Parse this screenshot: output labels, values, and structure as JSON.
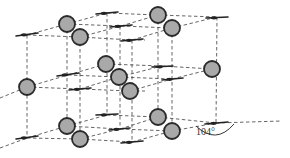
{
  "diagram": {
    "type": "crystal-lattice",
    "angle_label": "104°",
    "colors": {
      "sphere_fill": "#a9a9a9",
      "sphere_stroke": "#2a2a2a",
      "line": "#555555",
      "stick": "#222222",
      "background": "#ffffff"
    },
    "spheres": [
      {
        "id": "top-back-left",
        "x": 67,
        "y": 24,
        "r": 8
      },
      {
        "id": "top-front-left",
        "x": 80,
        "y": 37,
        "r": 8
      },
      {
        "id": "top-back-right",
        "x": 158,
        "y": 15,
        "r": 8
      },
      {
        "id": "top-front-right",
        "x": 172,
        "y": 28,
        "r": 8
      },
      {
        "id": "mid-left",
        "x": 27,
        "y": 87,
        "r": 8
      },
      {
        "id": "mid-center-back",
        "x": 106,
        "y": 64,
        "r": 8
      },
      {
        "id": "mid-center",
        "x": 119,
        "y": 77,
        "r": 8
      },
      {
        "id": "mid-center-front",
        "x": 130,
        "y": 91,
        "r": 8
      },
      {
        "id": "mid-right",
        "x": 212,
        "y": 69,
        "r": 8
      },
      {
        "id": "bottom-back-left",
        "x": 67,
        "y": 126,
        "r": 8
      },
      {
        "id": "bottom-front-left",
        "x": 80,
        "y": 139,
        "r": 8
      },
      {
        "id": "bottom-back-right",
        "x": 158,
        "y": 117,
        "r": 8
      },
      {
        "id": "bottom-front-right",
        "x": 172,
        "y": 131,
        "r": 8
      }
    ],
    "sticks": [
      {
        "x1": 16,
        "y1": 36,
        "x2": 38,
        "y2": 33
      },
      {
        "x1": 96,
        "y1": 14,
        "x2": 118,
        "y2": 12
      },
      {
        "x1": 110,
        "y1": 27,
        "x2": 132,
        "y2": 25
      },
      {
        "x1": 121,
        "y1": 41,
        "x2": 143,
        "y2": 39
      },
      {
        "x1": 206,
        "y1": 18,
        "x2": 228,
        "y2": 17
      },
      {
        "x1": 57,
        "y1": 76,
        "x2": 79,
        "y2": 73
      },
      {
        "x1": 69,
        "y1": 90,
        "x2": 91,
        "y2": 88
      },
      {
        "x1": 152,
        "y1": 67,
        "x2": 173,
        "y2": 66
      },
      {
        "x1": 162,
        "y1": 80,
        "x2": 183,
        "y2": 78
      },
      {
        "x1": 16,
        "y1": 139,
        "x2": 38,
        "y2": 136
      },
      {
        "x1": 96,
        "y1": 115,
        "x2": 118,
        "y2": 114
      },
      {
        "x1": 109,
        "y1": 130,
        "x2": 130,
        "y2": 128
      },
      {
        "x1": 121,
        "y1": 143,
        "x2": 143,
        "y2": 141
      },
      {
        "x1": 205,
        "y1": 124,
        "x2": 228,
        "y2": 122
      }
    ],
    "dashed_lines": [
      {
        "x1": 27,
        "y1": 35,
        "x2": 67,
        "y2": 24
      },
      {
        "x1": 27,
        "y1": 35,
        "x2": 80,
        "y2": 37
      },
      {
        "x1": 67,
        "y1": 24,
        "x2": 107,
        "y2": 13
      },
      {
        "x1": 67,
        "y1": 24,
        "x2": 121,
        "y2": 26
      },
      {
        "x1": 80,
        "y1": 37,
        "x2": 121,
        "y2": 26
      },
      {
        "x1": 80,
        "y1": 37,
        "x2": 132,
        "y2": 40
      },
      {
        "x1": 107,
        "y1": 13,
        "x2": 158,
        "y2": 15
      },
      {
        "x1": 121,
        "y1": 26,
        "x2": 158,
        "y2": 15
      },
      {
        "x1": 121,
        "y1": 26,
        "x2": 172,
        "y2": 28
      },
      {
        "x1": 132,
        "y1": 40,
        "x2": 172,
        "y2": 28
      },
      {
        "x1": 158,
        "y1": 15,
        "x2": 217,
        "y2": 17
      },
      {
        "x1": 172,
        "y1": 28,
        "x2": 217,
        "y2": 17
      },
      {
        "x1": 132,
        "y1": 40,
        "x2": 145,
        "y2": 40
      },
      {
        "x1": 27,
        "y1": 87,
        "x2": 68,
        "y2": 75
      },
      {
        "x1": 27,
        "y1": 87,
        "x2": 80,
        "y2": 89
      },
      {
        "x1": 68,
        "y1": 75,
        "x2": 106,
        "y2": 64
      },
      {
        "x1": 68,
        "y1": 75,
        "x2": 119,
        "y2": 77
      },
      {
        "x1": 80,
        "y1": 89,
        "x2": 119,
        "y2": 77
      },
      {
        "x1": 80,
        "y1": 89,
        "x2": 130,
        "y2": 91
      },
      {
        "x1": 106,
        "y1": 64,
        "x2": 162,
        "y2": 66
      },
      {
        "x1": 119,
        "y1": 77,
        "x2": 162,
        "y2": 66
      },
      {
        "x1": 119,
        "y1": 77,
        "x2": 172,
        "y2": 79
      },
      {
        "x1": 130,
        "y1": 91,
        "x2": 172,
        "y2": 79
      },
      {
        "x1": 162,
        "y1": 66,
        "x2": 212,
        "y2": 69
      },
      {
        "x1": 172,
        "y1": 79,
        "x2": 212,
        "y2": 69
      },
      {
        "x1": 130,
        "y1": 91,
        "x2": 145,
        "y2": 91
      },
      {
        "x1": 0,
        "y1": 98,
        "x2": 27,
        "y2": 87
      },
      {
        "x1": 27,
        "y1": 138,
        "x2": 67,
        "y2": 126
      },
      {
        "x1": 27,
        "y1": 138,
        "x2": 80,
        "y2": 139
      },
      {
        "x1": 67,
        "y1": 126,
        "x2": 107,
        "y2": 115
      },
      {
        "x1": 67,
        "y1": 126,
        "x2": 120,
        "y2": 129
      },
      {
        "x1": 80,
        "y1": 139,
        "x2": 120,
        "y2": 129
      },
      {
        "x1": 80,
        "y1": 139,
        "x2": 132,
        "y2": 142
      },
      {
        "x1": 107,
        "y1": 115,
        "x2": 158,
        "y2": 117
      },
      {
        "x1": 120,
        "y1": 129,
        "x2": 158,
        "y2": 117
      },
      {
        "x1": 120,
        "y1": 129,
        "x2": 172,
        "y2": 131
      },
      {
        "x1": 132,
        "y1": 142,
        "x2": 172,
        "y2": 131
      },
      {
        "x1": 158,
        "y1": 117,
        "x2": 216,
        "y2": 123
      },
      {
        "x1": 172,
        "y1": 131,
        "x2": 216,
        "y2": 123
      },
      {
        "x1": 216,
        "y1": 123,
        "x2": 282,
        "y2": 121
      },
      {
        "x1": 0,
        "y1": 148,
        "x2": 27,
        "y2": 138
      },
      {
        "x1": 27,
        "y1": 35,
        "x2": 27,
        "y2": 138
      },
      {
        "x1": 67,
        "y1": 24,
        "x2": 67,
        "y2": 126
      },
      {
        "x1": 80,
        "y1": 37,
        "x2": 80,
        "y2": 139
      },
      {
        "x1": 107,
        "y1": 13,
        "x2": 107,
        "y2": 115
      },
      {
        "x1": 120,
        "y1": 26,
        "x2": 120,
        "y2": 129
      },
      {
        "x1": 132,
        "y1": 40,
        "x2": 132,
        "y2": 142
      },
      {
        "x1": 158,
        "y1": 15,
        "x2": 158,
        "y2": 117
      },
      {
        "x1": 172,
        "y1": 28,
        "x2": 172,
        "y2": 131
      },
      {
        "x1": 217,
        "y1": 17,
        "x2": 216,
        "y2": 123
      }
    ],
    "angle_arc": {
      "cx": 216,
      "cy": 123,
      "label_x": 196,
      "label_y": 127
    }
  }
}
